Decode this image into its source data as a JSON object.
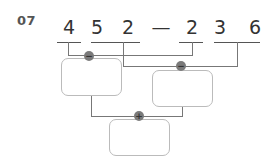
{
  "problem": {
    "number": "07",
    "expression": {
      "left_digits": [
        "4",
        "5",
        "2"
      ],
      "operator": "—",
      "right_digits": [
        "2",
        "3",
        "6"
      ]
    },
    "operations": [
      {
        "symbol": "−",
        "label": "minus"
      },
      {
        "symbol": "−",
        "label": "minus"
      },
      {
        "symbol": "+",
        "label": "plus"
      }
    ],
    "boxes": [
      {
        "value": ""
      },
      {
        "value": ""
      },
      {
        "value": ""
      }
    ]
  }
}
